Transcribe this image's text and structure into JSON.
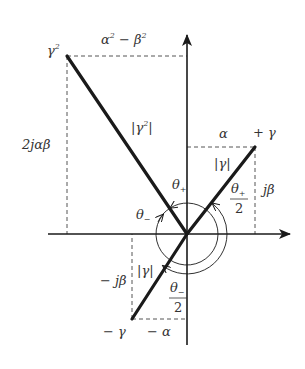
{
  "diagram": {
    "colors": {
      "ink": "#1a1a1a",
      "text": "#333333",
      "dashed": "#555555"
    },
    "points": {
      "gamma_squared": {
        "label": "γ",
        "sup": "2"
      },
      "plus_gamma": {
        "label": "+ γ"
      },
      "minus_gamma": {
        "label": "− γ"
      }
    },
    "labels": {
      "alpha2_minus_beta2": {
        "a": "α",
        "a_sup": "2",
        "mid": " − ",
        "b": "β",
        "b_sup": "2"
      },
      "two_j_alpha_beta": "2jαβ",
      "abs_gamma2": {
        "left": "|",
        "g": "γ",
        "sup": "2",
        "right": "|"
      },
      "alpha": "α",
      "j_beta": "jβ",
      "abs_gamma_upper": "|γ|",
      "abs_gamma_lower": "|γ|",
      "theta_plus": {
        "t": "θ",
        "sub": "+"
      },
      "theta_minus": {
        "t": "θ",
        "sub": "−"
      },
      "theta_plus_half": {
        "t": "θ",
        "sub": "+",
        "den": "2"
      },
      "theta_minus_half": {
        "t": "θ",
        "sub": "−",
        "den": "2"
      },
      "minus_j_beta": "− jβ",
      "minus_alpha": "− α"
    }
  }
}
